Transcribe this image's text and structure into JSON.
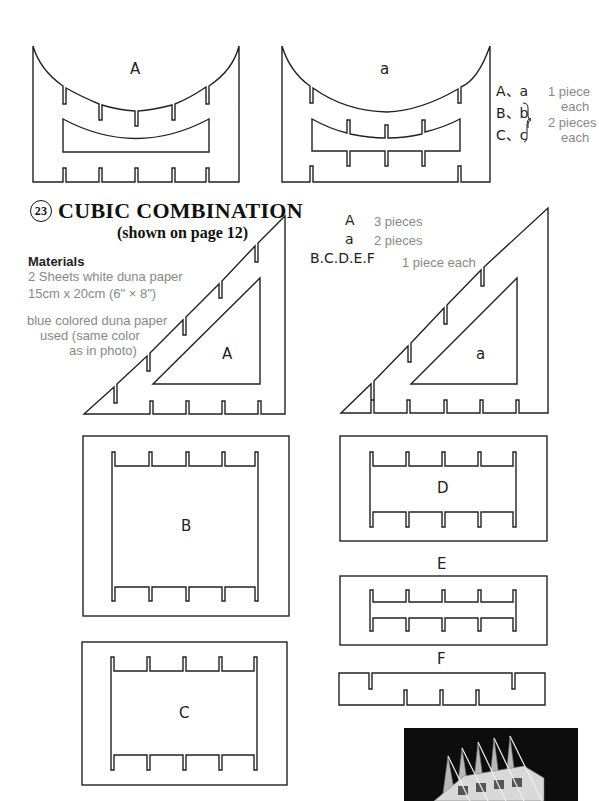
{
  "top_pieces": {
    "shape_A_label": "A",
    "shape_a_label": "a",
    "legend": {
      "row1": "A、a",
      "row2": "B、b",
      "row3": "C、c",
      "count1_line1": "1 piece",
      "count1_line2": "each",
      "count2_line1": "2 pieces",
      "count2_line2": "each"
    }
  },
  "section": {
    "number": "23",
    "title": "CUBIC COMBINATION",
    "subtitle": "(shown on page 12)"
  },
  "materials": {
    "heading": "Materials",
    "line1": "2 Sheets white duna paper",
    "line2": "15cm x 20cm (6\" × 8\")",
    "note_line1": "blue colored duna paper",
    "note_line2": "used (same color",
    "note_line3": "as in photo)"
  },
  "piece_counts": [
    {
      "key": "A",
      "count": "3 pieces"
    },
    {
      "key": "a",
      "count": "2 pieces"
    },
    {
      "key": "B.C.D.E.F",
      "count": "1 piece each"
    }
  ],
  "templates": {
    "triangle_A": "A",
    "triangle_a": "a",
    "rect_B": "B",
    "rect_C": "C",
    "rect_D": "D",
    "rect_E": "E",
    "rect_F": "F"
  },
  "photo": {
    "description": "photo of assembled cubic combination lattice"
  }
}
